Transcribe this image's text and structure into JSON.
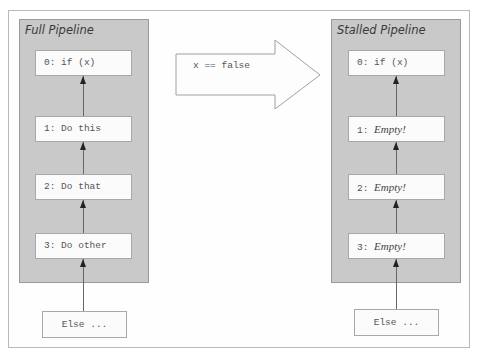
{
  "left_panel": {
    "title": "Full Pipeline",
    "stages": [
      {
        "index": "0:",
        "text": "if (x)",
        "empty": false
      },
      {
        "index": "1:",
        "text": "Do this",
        "empty": false
      },
      {
        "index": "2:",
        "text": "Do that",
        "empty": false
      },
      {
        "index": "3:",
        "text": "Do other",
        "empty": false
      }
    ],
    "input": "Else ..."
  },
  "transition": {
    "label": "x == false"
  },
  "right_panel": {
    "title": "Stalled Pipeline",
    "stages": [
      {
        "index": "0:",
        "text": "if (x)",
        "empty": false
      },
      {
        "index": "1:",
        "text": "Empty!",
        "empty": true
      },
      {
        "index": "2:",
        "text": "Empty!",
        "empty": true
      },
      {
        "index": "3:",
        "text": "Empty!",
        "empty": true
      }
    ],
    "input": "Else ..."
  },
  "colors": {
    "panel_fill": "#c9c9c9",
    "stage_fill": "#fbfbfb",
    "border": "#a8a8a8"
  }
}
